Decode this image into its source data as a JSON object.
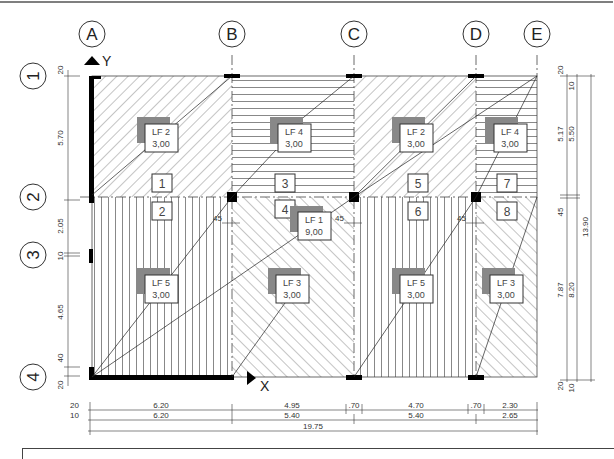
{
  "grid_axes": {
    "columns": [
      {
        "id": "A",
        "label": "A",
        "x": 92
      },
      {
        "id": "B",
        "label": "B",
        "x": 232
      },
      {
        "id": "C",
        "label": "C",
        "x": 354
      },
      {
        "id": "D",
        "label": "D",
        "x": 476
      },
      {
        "id": "E",
        "label": "E",
        "x": 537
      }
    ],
    "rows": [
      {
        "id": "1",
        "label": "1",
        "y": 76
      },
      {
        "id": "2",
        "label": "2",
        "y": 197
      },
      {
        "id": "3",
        "label": "3",
        "y": 255
      },
      {
        "id": "4",
        "label": "4",
        "y": 377
      }
    ]
  },
  "coordinate_axes": {
    "x_label": "X",
    "y_label": "Y"
  },
  "fields": [
    {
      "id": "1",
      "label": "1"
    },
    {
      "id": "2",
      "label": "2"
    },
    {
      "id": "3",
      "label": "3"
    },
    {
      "id": "4",
      "label": "4"
    },
    {
      "id": "5",
      "label": "5"
    },
    {
      "id": "6",
      "label": "6"
    },
    {
      "id": "7",
      "label": "7"
    },
    {
      "id": "8",
      "label": "8"
    }
  ],
  "load_cases": [
    {
      "name": "LF 2",
      "value": "3,00"
    },
    {
      "name": "LF 4",
      "value": "3,00"
    },
    {
      "name": "LF 2",
      "value": "3,00"
    },
    {
      "name": "LF 4",
      "value": "3,00"
    },
    {
      "name": "LF 1",
      "value": "9,00"
    },
    {
      "name": "LF 5",
      "value": "3,00"
    },
    {
      "name": "LF 3",
      "value": "3,00"
    },
    {
      "name": "LF 5",
      "value": "3,00"
    },
    {
      "name": "LF 3",
      "value": "3,00"
    }
  ],
  "dimensions": {
    "left": [
      "20",
      "5.70",
      "2.05",
      "10",
      "4.65",
      "40",
      "20"
    ],
    "right_inner": [
      "20",
      "5.17",
      "5",
      "45",
      "7.87",
      "5",
      "20"
    ],
    "right_middle": [
      "10",
      "5.50",
      "8.20",
      "10"
    ],
    "right_outer": [
      "13.90"
    ],
    "bottom_row1": [
      "20",
      "6.20",
      "4.95",
      ".70",
      "4.70",
      ".70",
      "2.30"
    ],
    "bottom_row2": [
      "10",
      "6.20",
      "5.40",
      "5.40",
      "2.65"
    ],
    "bottom_total": [
      "19.75"
    ],
    "support_offsets": [
      "45",
      "45",
      "45"
    ]
  }
}
